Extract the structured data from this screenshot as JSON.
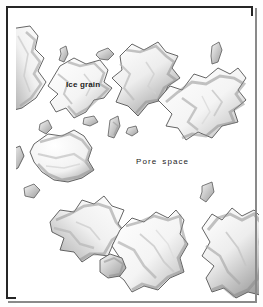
{
  "figure": {
    "medium": "pencil drawing",
    "frame": {
      "border_color": "#252525",
      "background_color": "#ffffff",
      "shadow_color": "#8a8a8a"
    },
    "labels": {
      "ice_grain": "Ice grain",
      "pore_space_word1": "Pore",
      "pore_space_word2": "space",
      "text_color": "#1c1c1c"
    },
    "palette": {
      "grain_fill": "#fbfbfb",
      "grain_outline": "#4a4a4a",
      "grain_shadow": "#8d8d8d",
      "grain_deep_shadow": "#5f5f5f",
      "paper": "#ffffff"
    },
    "counts": {
      "large_grains": "12",
      "small_fragments": "9"
    }
  }
}
